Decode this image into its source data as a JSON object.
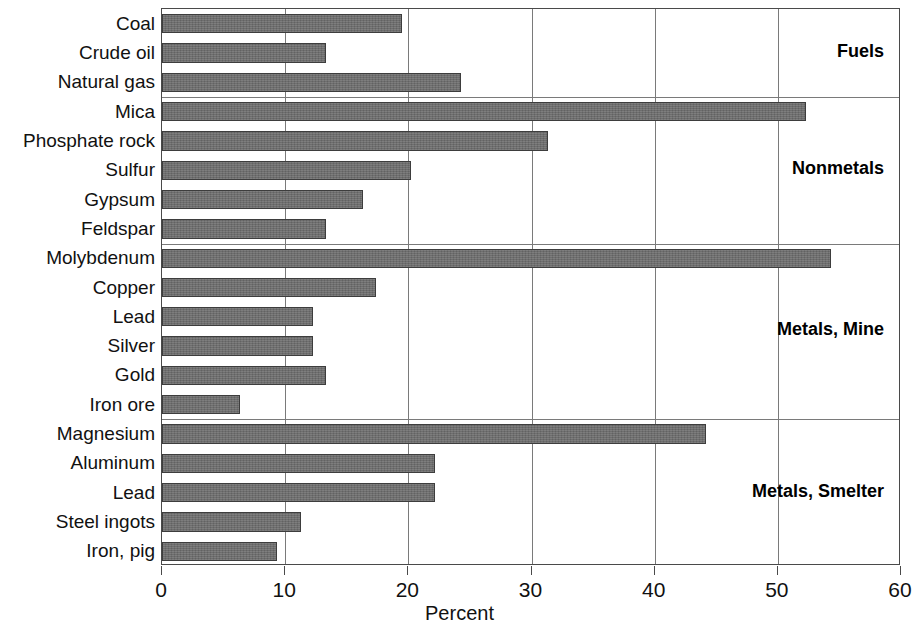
{
  "chart_data": {
    "type": "bar",
    "orientation": "horizontal",
    "title": "",
    "xlabel": "Percent",
    "ylabel": "",
    "xlim": [
      0,
      60
    ],
    "xticks": [
      0,
      10,
      20,
      30,
      40,
      50,
      60
    ],
    "xtick_labels": [
      "0",
      "10",
      "20",
      "30",
      "40",
      "50",
      "60"
    ],
    "grid": "vertical",
    "legend": "none",
    "categories": [
      "Coal",
      "Crude oil",
      "Natural gas",
      "Mica",
      "Phosphate rock",
      "Sulfur",
      "Gypsum",
      "Feldspar",
      "Molybdenum",
      "Copper",
      "Lead",
      "Silver",
      "Gold",
      "Iron ore",
      "Magnesium",
      "Aluminum",
      "Lead",
      "Steel ingots",
      "Iron, pig"
    ],
    "values": [
      19.5,
      13.3,
      24.3,
      52.3,
      31.3,
      20.2,
      16.3,
      13.3,
      54.3,
      17.4,
      12.3,
      12.3,
      13.3,
      6.3,
      44.2,
      22.2,
      22.2,
      11.3,
      9.3
    ],
    "groups": [
      {
        "label": "Fuels",
        "start": 0,
        "end": 2
      },
      {
        "label": "Nonmetals",
        "start": 3,
        "end": 7
      },
      {
        "label": "Metals, Mine",
        "start": 8,
        "end": 13
      },
      {
        "label": "Metals, Smelter",
        "start": 14,
        "end": 18
      }
    ],
    "colors": {
      "bar_fill": "#6b6b6b",
      "bar_edge": "#3d3d3d",
      "grid": "#7a7a7a",
      "axis": "#4a4a4a",
      "text": "#111111",
      "background": "#ffffff"
    }
  }
}
